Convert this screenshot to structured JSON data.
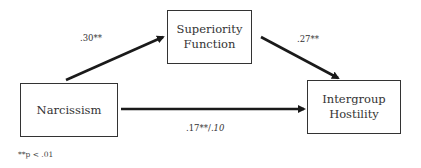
{
  "diagram": {
    "type": "mediation-path-diagram",
    "nodes": {
      "narcissism": {
        "lines": [
          "Narcissism"
        ]
      },
      "superiority": {
        "lines": [
          "Superiority",
          "Function"
        ]
      },
      "hostility": {
        "lines": [
          "Intergroup",
          "Hostility"
        ]
      }
    },
    "paths": {
      "a": {
        "from": "Narcissism",
        "to": "Superiority Function",
        "label": ".30**"
      },
      "b": {
        "from": "Superiority Function",
        "to": "Intergroup Hostility",
        "label": ".27**"
      },
      "c": {
        "from": "Narcissism",
        "to": "Intergroup Hostility",
        "label_total": ".17**/",
        "label_direct": ".10"
      }
    },
    "footnote": "**p < .01",
    "colors": {
      "stroke": "#333333",
      "text": "#333333",
      "background": "#ffffff"
    }
  }
}
